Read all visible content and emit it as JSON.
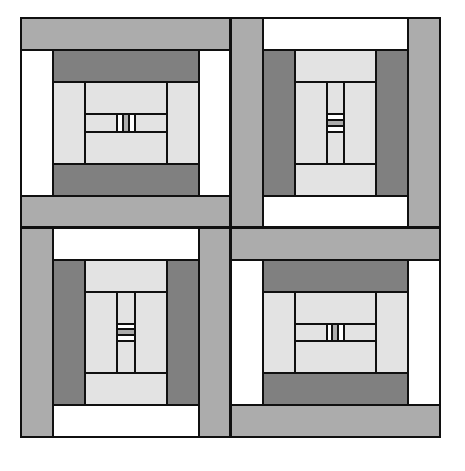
{
  "artwork": {
    "title": "Log Cabin Quilt Block Pattern",
    "kind": "quilt-pattern",
    "canvas": {
      "width": 465,
      "height": 471,
      "background": "#ffffff"
    },
    "outline": {
      "x": 21,
      "y": 18,
      "width": 419,
      "height": 419
    },
    "palette": {
      "white": "#ffffff",
      "light_gray": "#e3e3e3",
      "medium_gray": "#acacac",
      "dark_gray": "#808080",
      "outline": "#101010"
    },
    "grid": {
      "rows": 2,
      "cols": 2,
      "block_size": 209.5
    },
    "strip_unit": 32,
    "blocks": [
      {
        "name": "block-top-left",
        "position": "top-left",
        "rotation": 0,
        "origin": {
          "x": 21,
          "y": 18
        },
        "size": 209.5
      },
      {
        "name": "block-top-right",
        "position": "top-right",
        "rotation": 90,
        "origin": {
          "x": 230.5,
          "y": 18
        },
        "size": 209.5
      },
      {
        "name": "block-bottom-left",
        "position": "bottom-left",
        "rotation": 270,
        "origin": {
          "x": 21,
          "y": 227.5
        },
        "size": 209.5
      },
      {
        "name": "block-bottom-right",
        "position": "bottom-right",
        "rotation": 180,
        "origin": {
          "x": 230.5,
          "y": 227.5
        },
        "size": 209.5
      }
    ],
    "block_template": {
      "description": "Concentric log cabin block: strips wrap counter-clockwise from the outer edge inward, ending in a three-part center bar.",
      "rings": [
        {
          "ring": 1,
          "top": "medium_gray",
          "left": "white",
          "bottom": "medium_gray",
          "right": "white"
        },
        {
          "ring": 2,
          "top": "dark_gray",
          "left": "light_gray",
          "bottom": "dark_gray",
          "right": "light_gray"
        },
        {
          "ring": 3,
          "top": "light_gray",
          "left": "light_gray",
          "bottom": "light_gray",
          "right": "light_gray"
        }
      ],
      "center": {
        "left_square": "white",
        "middle_square": "medium_gray",
        "right_square": "white"
      }
    }
  }
}
